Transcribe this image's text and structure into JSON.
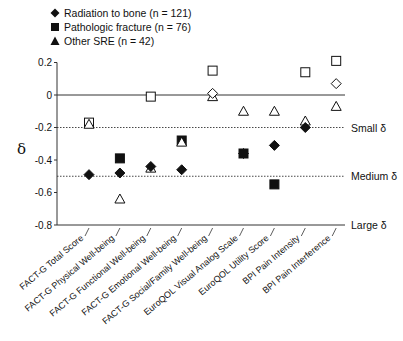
{
  "chart_data": {
    "type": "scatter",
    "title": "",
    "xlabel": "",
    "ylabel": "δ",
    "ylim": [
      -0.8,
      0.2
    ],
    "yticks": [
      "0.2",
      "0",
      "-0.2",
      "-0.4",
      "-0.6",
      "-0.8"
    ],
    "ytick_values": [
      0.2,
      0,
      -0.2,
      -0.4,
      -0.6,
      -0.8
    ],
    "grid": false,
    "legend_position": "top-left",
    "categories": [
      "FACT-G Total Score",
      "FACT-G Physical Well-being",
      "FACT-G Functional Well-being",
      "FACT-G Emotional Well-being",
      "FACT-G Social/Family Well-being",
      "EuroQOL Visual Analog Scale",
      "EuroQOL Utility Score",
      "BPI Pain Intensity",
      "BPI Pain Interference"
    ],
    "series": [
      {
        "name": "Radiation to bone (n = 121)",
        "marker": "diamond",
        "values": [
          -0.49,
          -0.48,
          -0.44,
          -0.46,
          0.01,
          -0.36,
          -0.31,
          -0.2,
          0.07
        ],
        "filled": [
          true,
          true,
          true,
          true,
          false,
          true,
          true,
          true,
          false
        ]
      },
      {
        "name": "Pathologic fracture (n = 76)",
        "marker": "square",
        "values": [
          -0.17,
          -0.39,
          -0.01,
          -0.28,
          0.15,
          -0.36,
          -0.55,
          0.14,
          0.21
        ],
        "filled": [
          false,
          true,
          false,
          true,
          false,
          true,
          true,
          false,
          false
        ]
      },
      {
        "name": "Other SRE (n = 42)",
        "marker": "triangle",
        "values": [
          -0.18,
          -0.64,
          -0.45,
          -0.29,
          -0.01,
          -0.1,
          -0.1,
          -0.16,
          -0.07
        ],
        "filled": [
          false,
          false,
          false,
          false,
          false,
          false,
          false,
          false,
          false
        ]
      }
    ],
    "reference_lines": [
      {
        "value": 0,
        "style": "solid",
        "label": ""
      },
      {
        "value": -0.2,
        "style": "dotted",
        "label": "Small δ"
      },
      {
        "value": -0.5,
        "style": "dotted",
        "label": "Medium δ"
      },
      {
        "value": -0.8,
        "style": "solid",
        "label": "Large δ"
      }
    ]
  },
  "legend": {
    "items": [
      {
        "label": "Radiation to bone (n = 121)",
        "symbol": "diamond"
      },
      {
        "label": "Pathologic fracture (n = 76)",
        "symbol": "square"
      },
      {
        "label": "Other SRE (n = 42)",
        "symbol": "triangle"
      }
    ]
  },
  "axis": {
    "y_label": "δ"
  }
}
